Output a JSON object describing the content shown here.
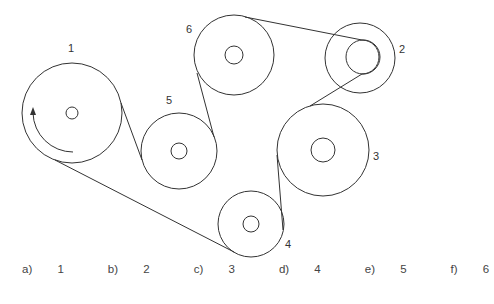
{
  "diagram": {
    "pulleys": [
      {
        "label": "1",
        "cx": 72,
        "cy": 113,
        "r": 50,
        "hub_r": 6,
        "label_x": 70,
        "label_y": 43
      },
      {
        "label": "2",
        "cx": 360,
        "cy": 58,
        "r": 35,
        "hub_r": 17,
        "hub_cx": 363,
        "hub_cy": 57,
        "label_x": 401,
        "label_y": 44
      },
      {
        "label": "3",
        "cx": 323,
        "cy": 150,
        "r": 46,
        "hub_r": 12,
        "label_x": 375,
        "label_y": 150
      },
      {
        "label": "4",
        "cx": 251,
        "cy": 224,
        "r": 33,
        "hub_r": 8,
        "label_x": 287,
        "label_y": 238
      },
      {
        "label": "5",
        "cx": 179,
        "cy": 151,
        "r": 38,
        "hub_r": 8,
        "label_x": 167,
        "label_y": 95
      },
      {
        "label": "6",
        "cx": 234,
        "cy": 55,
        "r": 40,
        "hub_r": 9,
        "label_x": 186,
        "label_y": 24
      }
    ],
    "rotation_arrow": {
      "on_pulley": "1",
      "direction": "clockwise-up"
    },
    "stroke_color": "#333333"
  },
  "answers": [
    {
      "letter": "a)",
      "value": "1"
    },
    {
      "letter": "b)",
      "value": "2"
    },
    {
      "letter": "c)",
      "value": "3"
    },
    {
      "letter": "d)",
      "value": "4"
    },
    {
      "letter": "e)",
      "value": "5"
    },
    {
      "letter": "f)",
      "value": "6"
    }
  ]
}
